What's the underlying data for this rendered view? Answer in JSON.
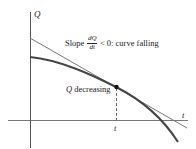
{
  "diagram": {
    "axes": {
      "y_label": "Q",
      "x_label": "t",
      "tick_label": "t"
    },
    "annotations": {
      "slope": {
        "prefix": "Slope",
        "frac_num": "dQ",
        "frac_den": "dt",
        "suffix": "< 0: curve falling"
      },
      "point": {
        "q_symbol": "Q",
        "text": "decreasing"
      }
    },
    "colors": {
      "curve": "#444444",
      "tangent": "#777777",
      "axes": "#555555",
      "point": "#111111"
    }
  }
}
